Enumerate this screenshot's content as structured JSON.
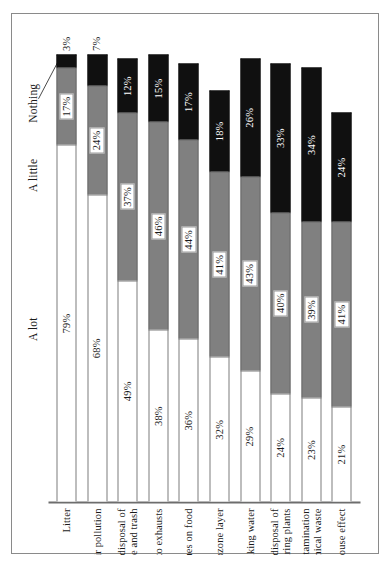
{
  "chart_data": {
    "type": "bar",
    "orientation": "horizontal-stacked-rotated",
    "title": "",
    "xlabel": "",
    "ylabel": "",
    "xlim": [
      0,
      100
    ],
    "grid": false,
    "legend_position": "top-left",
    "categories": [
      "Litter",
      "Indoor air pollution",
      "Solid waste from disposal of\ngarbage and trash",
      "Air pollution from auto exhausts",
      "Pesticide residues on food",
      "Destruction of the ozone layer",
      "Contaminated drinking water",
      "Water pollution from disposal of\nwaste by manufacturing plants",
      "Environmental contamination\nfrom chemical waste",
      "The greenhouse effect"
    ],
    "series": [
      {
        "name": "A lot",
        "color": "#ffffff",
        "values": [
          79,
          68,
          49,
          38,
          36,
          32,
          29,
          24,
          23,
          21
        ],
        "labels": [
          "79%",
          "68%",
          "49%",
          "38%",
          "36%",
          "32%",
          "29%",
          "24%",
          "23%",
          "21%"
        ]
      },
      {
        "name": "A little",
        "color": "#808080",
        "values": [
          17,
          24,
          37,
          46,
          44,
          41,
          43,
          40,
          39,
          41
        ],
        "labels": [
          "17%",
          "24%",
          "37%",
          "46%",
          "44%",
          "41%",
          "43%",
          "40%",
          "39%",
          "41%"
        ]
      },
      {
        "name": "Nothing",
        "color": "#101010",
        "values": [
          3,
          7,
          12,
          15,
          17,
          18,
          26,
          33,
          34,
          24
        ],
        "labels": [
          "3%",
          "7%",
          "12%",
          "15%",
          "17%",
          "18%",
          "26%",
          "33%",
          "34%",
          "24%"
        ]
      }
    ]
  },
  "legend": {
    "a_lot": "A lot",
    "a_little": "A little",
    "nothing": "Nothing"
  }
}
